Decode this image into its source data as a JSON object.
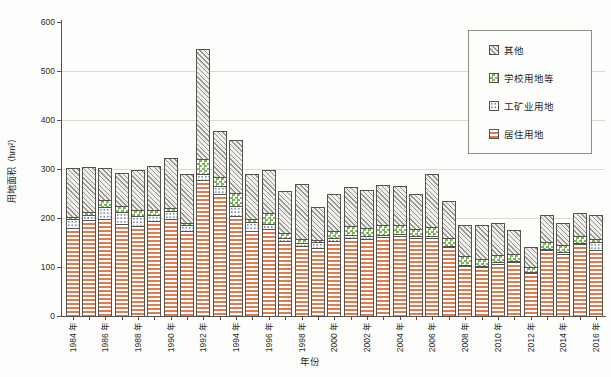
{
  "axes": {
    "y_title": "用地面积（hm²）",
    "x_title": "年份",
    "y_ticks": [
      0,
      100,
      200,
      300,
      400,
      500,
      600
    ]
  },
  "legend": {
    "items": [
      {
        "label": "其他",
        "key": "other",
        "pattern": "hatch"
      },
      {
        "label": "学校用地等",
        "key": "school",
        "pattern": "checker"
      },
      {
        "label": "工矿业用地",
        "key": "industry",
        "pattern": "dots"
      },
      {
        "label": "居住用地",
        "key": "residential",
        "pattern": "stripes"
      }
    ]
  },
  "colors": {
    "residential_stripe": "#e07a4f",
    "industry_dot": "#8494b6",
    "school_green": "#7eb660",
    "other_hatch_line": "#97968e",
    "bar_outline": "#55534e",
    "axis": "#51504b",
    "grid": "#dbdad5",
    "background": "#fdfdfb"
  },
  "chart_data": {
    "type": "bar",
    "stacked": true,
    "title": "",
    "xlabel": "年份",
    "ylabel": "用地面积（hm²）",
    "ylim": [
      0,
      600
    ],
    "grid": "horizontal-light",
    "legend_position": "upper-right-inside",
    "categories": [
      1984,
      1985,
      1986,
      1987,
      1988,
      1989,
      1990,
      1991,
      1992,
      1993,
      1994,
      1995,
      1996,
      1997,
      1998,
      1999,
      2000,
      2001,
      2002,
      2003,
      2004,
      2005,
      2006,
      2007,
      2008,
      2009,
      2010,
      2011,
      2012,
      2013,
      2014,
      2015,
      2016
    ],
    "x_tick_labels": [
      "1984 年",
      "1986 年",
      "1988 年",
      "1990 年",
      "1992 年",
      "1994 年",
      "1996 年",
      "1998 年",
      "2000 年",
      "2002 年",
      "2004 年",
      "2006 年",
      "2008 年",
      "2010 年",
      "2012 年",
      "2014 年",
      "2016 年"
    ],
    "series": [
      {
        "name": "居住用地",
        "key": "residential",
        "pattern": "stripes",
        "values": [
          180,
          196,
          198,
          187,
          183,
          193,
          198,
          174,
          277,
          249,
          205,
          174,
          178,
          153,
          142,
          138,
          153,
          160,
          157,
          162,
          164,
          160,
          160,
          141,
          103,
          100,
          107,
          110,
          87,
          134,
          127,
          147,
          134
        ]
      },
      {
        "name": "工矿业用地",
        "key": "industry",
        "pattern": "dots",
        "values": [
          18,
          10,
          24,
          25,
          22,
          14,
          17,
          11,
          13,
          17,
          20,
          17,
          10,
          7,
          7,
          14,
          7,
          6,
          7,
          4,
          3,
          3,
          4,
          2,
          2,
          2,
          4,
          3,
          2,
          3,
          3,
          3,
          17
        ]
      },
      {
        "name": "学校用地等",
        "key": "school",
        "pattern": "checker",
        "values": [
          5,
          6,
          14,
          13,
          11,
          9,
          6,
          5,
          30,
          17,
          25,
          7,
          22,
          10,
          9,
          3,
          14,
          17,
          16,
          19,
          18,
          15,
          17,
          17,
          17,
          15,
          13,
          14,
          11,
          14,
          14,
          14,
          7
        ]
      },
      {
        "name": "其他",
        "key": "other",
        "pattern": "hatch",
        "values": [
          100,
          92,
          66,
          67,
          82,
          90,
          101,
          100,
          225,
          95,
          110,
          92,
          88,
          85,
          112,
          67,
          76,
          81,
          77,
          83,
          81,
          71,
          108,
          75,
          63,
          68,
          66,
          49,
          41,
          54,
          46,
          46,
          48
        ]
      }
    ]
  }
}
